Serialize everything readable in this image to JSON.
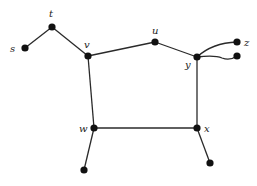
{
  "diagram": {
    "type": "graph",
    "labels": {
      "s": "s",
      "t": "t",
      "u": "u",
      "v": "v",
      "w": "w",
      "x": "x",
      "y": "y",
      "z": "z"
    },
    "nodes": [
      {
        "id": "s",
        "label": "s"
      },
      {
        "id": "t",
        "label": "t"
      },
      {
        "id": "v",
        "label": "v"
      },
      {
        "id": "u",
        "label": "u"
      },
      {
        "id": "y",
        "label": "y"
      },
      {
        "id": "z",
        "label": "z"
      },
      {
        "id": "y2",
        "label": ""
      },
      {
        "id": "w",
        "label": "w"
      },
      {
        "id": "x",
        "label": "x"
      },
      {
        "id": "w2",
        "label": ""
      },
      {
        "id": "x2",
        "label": ""
      }
    ],
    "edges": [
      [
        "s",
        "t"
      ],
      [
        "t",
        "v"
      ],
      [
        "v",
        "u"
      ],
      [
        "u",
        "y"
      ],
      [
        "y",
        "z"
      ],
      [
        "y",
        "y2"
      ],
      [
        "v",
        "w"
      ],
      [
        "y",
        "x"
      ],
      [
        "w",
        "x"
      ],
      [
        "w",
        "w2"
      ],
      [
        "x",
        "x2"
      ]
    ]
  }
}
